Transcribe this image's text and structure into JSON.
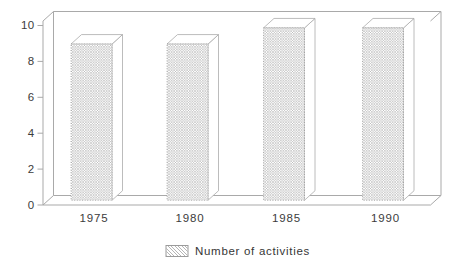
{
  "chart_data": {
    "type": "bar",
    "style": "3d-column-hatched",
    "title": "",
    "xlabel": "",
    "ylabel": "",
    "categories": [
      "1975",
      "1980",
      "1985",
      "1990"
    ],
    "series": [
      {
        "name": "Number of activities",
        "values": [
          8.7,
          8.7,
          9.6,
          9.6
        ]
      }
    ],
    "ylim": [
      0,
      10
    ],
    "yticks": [
      0,
      2,
      4,
      6,
      8,
      10
    ],
    "grid": false,
    "legend": {
      "position": "bottom-center",
      "entries": [
        "Number of activities"
      ]
    }
  },
  "colors": {
    "background": "#ffffff",
    "frame_line": "#a9a9a9",
    "bar_hatch": "#b2b2b2",
    "bar_face": "#ffffff",
    "bar_edge": "#ababab",
    "bar_front_edge_dotted": "#8f8f8f",
    "text": "#3c3c3c"
  }
}
